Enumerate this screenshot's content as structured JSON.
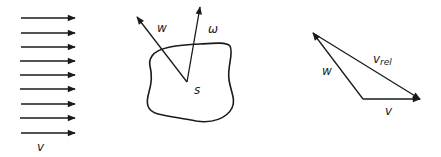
{
  "diagram": {
    "stream": {
      "label": "v",
      "arrow_count": 9,
      "arrows_y": [
        18,
        33,
        47,
        61,
        75,
        89,
        104,
        118,
        133
      ],
      "x_start": 21,
      "x_end": 75
    },
    "body": {
      "center_label": "s",
      "vector_w_label": "w",
      "vector_omega_label": "ω"
    },
    "triangle": {
      "rel_label_main": "v",
      "rel_label_sub": "rel",
      "w_label": "w",
      "v_label": "v"
    },
    "colors": {
      "stroke": "#1a1a1a",
      "background": "#ffffff"
    }
  }
}
